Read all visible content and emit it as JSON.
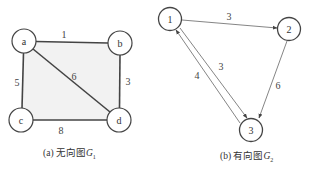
{
  "figure_a": {
    "caption_prefix": "(a) 无向图",
    "caption_var": "G",
    "caption_sub": "1",
    "nodes": [
      {
        "id": "a",
        "label": "a",
        "x": 24,
        "y": 41
      },
      {
        "id": "b",
        "label": "b",
        "x": 120,
        "y": 43
      },
      {
        "id": "c",
        "label": "c",
        "x": 21,
        "y": 120
      },
      {
        "id": "d",
        "label": "d",
        "x": 119,
        "y": 120
      }
    ],
    "edges": [
      {
        "from": "a",
        "to": "b",
        "weight": "1"
      },
      {
        "from": "a",
        "to": "c",
        "weight": "5"
      },
      {
        "from": "a",
        "to": "d",
        "weight": "6"
      },
      {
        "from": "b",
        "to": "d",
        "weight": "3"
      },
      {
        "from": "c",
        "to": "d",
        "weight": "8"
      }
    ],
    "fill_color": "#f2f2f2",
    "edge_color": "#444444"
  },
  "figure_b": {
    "caption_prefix": "(b) 有向图",
    "caption_var": "G",
    "caption_sub": "2",
    "nodes": [
      {
        "id": "1",
        "label": "1",
        "x": 170,
        "y": 19
      },
      {
        "id": "2",
        "label": "2",
        "x": 289,
        "y": 29
      },
      {
        "id": "3",
        "label": "3",
        "x": 251,
        "y": 130
      }
    ],
    "edges": [
      {
        "from": "1",
        "to": "2",
        "weight": "3"
      },
      {
        "from": "1",
        "to": "3",
        "weight": "3"
      },
      {
        "from": "3",
        "to": "1",
        "weight": "4"
      },
      {
        "from": "2",
        "to": "3",
        "weight": "6"
      }
    ],
    "edge_color": "#666666"
  },
  "labels": {
    "a": "a",
    "b": "b",
    "c": "c",
    "d": "d",
    "w_ab": "1",
    "w_ac": "5",
    "w_ad": "6",
    "w_bd": "3",
    "w_cd": "8",
    "n1": "1",
    "n2": "2",
    "n3": "3",
    "w_12": "3",
    "w_13": "3",
    "w_31": "4",
    "w_23": "6"
  }
}
